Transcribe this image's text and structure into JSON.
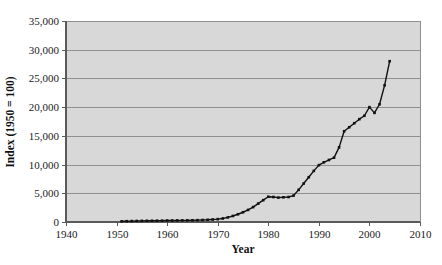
{
  "chart_data": {
    "type": "line",
    "title": "",
    "xlabel": "Year",
    "ylabel": "Index (1950 = 100)",
    "xlim": [
      1940,
      2010
    ],
    "ylim": [
      0,
      35000
    ],
    "xticks": [
      1940,
      1950,
      1960,
      1970,
      1980,
      1990,
      2000,
      2010
    ],
    "xtick_labels": [
      "1940",
      "1950",
      "1960",
      "1970",
      "1980",
      "1990",
      "2000",
      "2010"
    ],
    "yticks": [
      0,
      5000,
      10000,
      15000,
      20000,
      25000,
      30000,
      35000
    ],
    "ytick_labels": [
      "0",
      "5,000",
      "10,000",
      "15,000",
      "20,000",
      "25,000",
      "30,000",
      "35,000"
    ],
    "grid": "horizontal",
    "legend": "none",
    "marker": "square",
    "plot_background": "#d8d8d8",
    "gridline_color": "#8f8f8f",
    "series_color": "#111111",
    "x": [
      1951,
      1952,
      1953,
      1954,
      1955,
      1956,
      1957,
      1958,
      1959,
      1960,
      1961,
      1962,
      1963,
      1964,
      1965,
      1966,
      1967,
      1968,
      1969,
      1970,
      1971,
      1972,
      1973,
      1974,
      1975,
      1976,
      1977,
      1978,
      1979,
      1980,
      1981,
      1982,
      1983,
      1984,
      1985,
      1986,
      1987,
      1988,
      1989,
      1990,
      1991,
      1992,
      1993,
      1994,
      1995,
      1996,
      1997,
      1998,
      1999,
      2000,
      2001,
      2002,
      2003,
      2004
    ],
    "values": [
      120,
      140,
      160,
      180,
      200,
      210,
      220,
      230,
      240,
      250,
      260,
      270,
      280,
      290,
      300,
      320,
      350,
      380,
      430,
      500,
      620,
      800,
      1050,
      1350,
      1700,
      2100,
      2600,
      3200,
      3800,
      4400,
      4350,
      4250,
      4300,
      4350,
      4600,
      5600,
      6700,
      7800,
      8900,
      9900,
      10400,
      10800,
      11200,
      13000,
      15800,
      16500,
      17200,
      17900,
      18500,
      20000,
      19000,
      20500,
      23800,
      28000
    ]
  }
}
